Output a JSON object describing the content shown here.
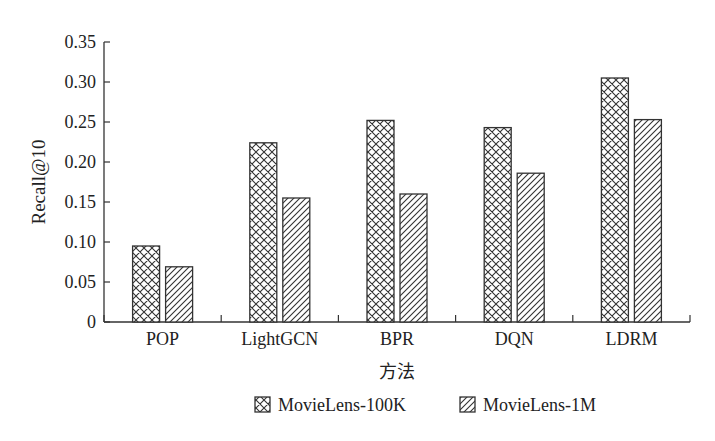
{
  "chart_data": {
    "type": "bar",
    "title": "",
    "xlabel": "方法",
    "ylabel": "Recall@10",
    "categories": [
      "POP",
      "LightGCN",
      "BPR",
      "DQN",
      "LDRM"
    ],
    "series": [
      {
        "name": "MovieLens-100K",
        "pattern": "crosshatch",
        "values": [
          0.095,
          0.224,
          0.252,
          0.243,
          0.305
        ]
      },
      {
        "name": "MovieLens-1M",
        "pattern": "diagonal",
        "values": [
          0.069,
          0.155,
          0.16,
          0.186,
          0.253
        ]
      }
    ],
    "ylim": [
      0,
      0.35
    ],
    "yticks": [
      "0",
      "0.05",
      "0.10",
      "0.15",
      "0.20",
      "0.25",
      "0.30",
      "0.35"
    ],
    "grid": false,
    "legend_position": "bottom"
  }
}
